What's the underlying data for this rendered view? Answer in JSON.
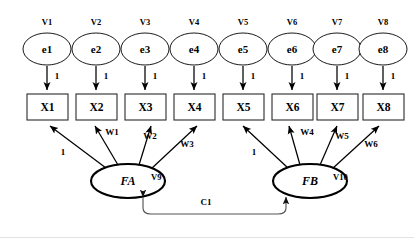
{
  "diagram": {
    "type": "path-diagram",
    "background_color": "#ffffff",
    "stroke_color": "#000000",
    "errors": [
      {
        "id": "e1",
        "label": "e1",
        "variance_label": "V1"
      },
      {
        "id": "e2",
        "label": "e2",
        "variance_label": "V2"
      },
      {
        "id": "e3",
        "label": "e3",
        "variance_label": "V3"
      },
      {
        "id": "e4",
        "label": "e4",
        "variance_label": "V4"
      },
      {
        "id": "e5",
        "label": "e5",
        "variance_label": "V5"
      },
      {
        "id": "e6",
        "label": "e6",
        "variance_label": "V6"
      },
      {
        "id": "e7",
        "label": "e7",
        "variance_label": "V7"
      },
      {
        "id": "e8",
        "label": "e8",
        "variance_label": "V8"
      }
    ],
    "indicators": [
      {
        "id": "X1",
        "label": "X1"
      },
      {
        "id": "X2",
        "label": "X2"
      },
      {
        "id": "X3",
        "label": "X3"
      },
      {
        "id": "X4",
        "label": "X4"
      },
      {
        "id": "X5",
        "label": "X5"
      },
      {
        "id": "X6",
        "label": "X6"
      },
      {
        "id": "X7",
        "label": "X7"
      },
      {
        "id": "X8",
        "label": "X8"
      }
    ],
    "error_paths": [
      {
        "from": "e1",
        "to": "X1",
        "label": "1"
      },
      {
        "from": "e2",
        "to": "X2",
        "label": "1"
      },
      {
        "from": "e3",
        "to": "X3",
        "label": "1"
      },
      {
        "from": "e4",
        "to": "X4",
        "label": "1"
      },
      {
        "from": "e5",
        "to": "X5",
        "label": "1"
      },
      {
        "from": "e6",
        "to": "X6",
        "label": "1"
      },
      {
        "from": "e7",
        "to": "X7",
        "label": "1"
      },
      {
        "from": "e8",
        "to": "X8",
        "label": "1"
      }
    ],
    "factors": [
      {
        "id": "FA",
        "label": "FA",
        "variance_label": "V9"
      },
      {
        "id": "FB",
        "label": "FB",
        "variance_label": "V10"
      }
    ],
    "loadings": [
      {
        "from": "FA",
        "to": "X1",
        "label": "1"
      },
      {
        "from": "FA",
        "to": "X2",
        "label": "W1"
      },
      {
        "from": "FA",
        "to": "X3",
        "label": "W2"
      },
      {
        "from": "FA",
        "to": "X4",
        "label": "W3"
      },
      {
        "from": "FB",
        "to": "X5",
        "label": "1"
      },
      {
        "from": "FB",
        "to": "X6",
        "label": "W4"
      },
      {
        "from": "FB",
        "to": "X7",
        "label": "W5"
      },
      {
        "from": "FB",
        "to": "X8",
        "label": "W6"
      }
    ],
    "covariance": {
      "between": [
        "FA",
        "FB"
      ],
      "label": "C1"
    }
  }
}
